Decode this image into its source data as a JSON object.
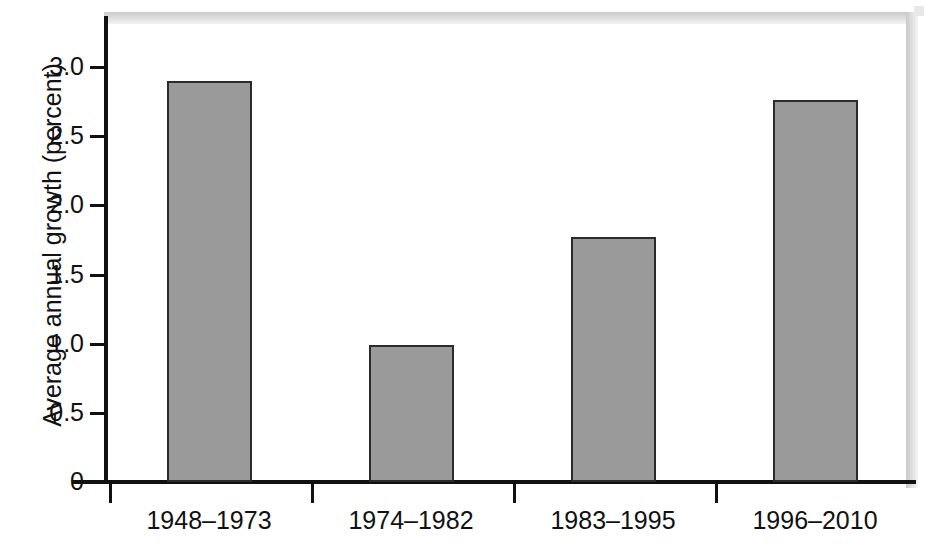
{
  "chart_data": {
    "type": "bar",
    "title": "",
    "subtitle": "",
    "xlabel": "",
    "ylabel": "Average annual growth (percent)",
    "categories": [
      "1948–1973",
      "1974–1982",
      "1983–1995",
      "1996–2010"
    ],
    "values": [
      2.9,
      0.99,
      1.77,
      2.76
    ],
    "ylim": [
      0,
      3.35
    ],
    "xlim": [
      0,
      4
    ],
    "ytick_labels": [
      "0",
      "0.5",
      "1.0",
      "1.5",
      "2.0",
      "2.5",
      "3.0"
    ],
    "ytick_values": [
      0,
      0.5,
      1.0,
      1.5,
      2.0,
      2.5,
      3.0
    ],
    "grid": false,
    "legend": false,
    "legend_position": "none",
    "series": [
      {
        "name": "Average annual growth",
        "values": [
          2.9,
          0.99,
          1.77,
          2.76
        ]
      }
    ],
    "annotations": [],
    "colors": {
      "bar_fill": "#9a9a9a",
      "bar_edge": "#2b2b2b",
      "axis": "#111111",
      "text": "#111111",
      "background": "#ffffff"
    }
  },
  "axis": {
    "y_title": "Average annual growth (percent)"
  }
}
